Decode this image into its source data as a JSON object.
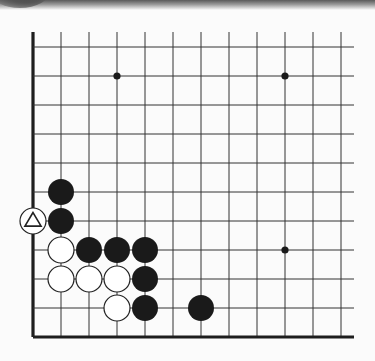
{
  "diagram": {
    "grid": {
      "columns_x": [
        33,
        61,
        89,
        117,
        145,
        173,
        201,
        229,
        257,
        285,
        313,
        341
      ],
      "rows_y": [
        47,
        76,
        105,
        134,
        163,
        192,
        221,
        250,
        279,
        308,
        337
      ],
      "top_y": 32,
      "right_x": 354,
      "left_edge_col": 0,
      "bottom_edge_row": 10
    },
    "star_points": [
      {
        "col": 3,
        "row": 1
      },
      {
        "col": 9,
        "row": 1
      },
      {
        "col": 9,
        "row": 7
      }
    ],
    "stones": [
      {
        "color": "black",
        "col": 1,
        "row": 5
      },
      {
        "color": "black",
        "col": 1,
        "row": 6
      },
      {
        "color": "black",
        "col": 2,
        "row": 7
      },
      {
        "color": "black",
        "col": 3,
        "row": 7
      },
      {
        "color": "black",
        "col": 4,
        "row": 7
      },
      {
        "color": "black",
        "col": 4,
        "row": 8
      },
      {
        "color": "black",
        "col": 4,
        "row": 9
      },
      {
        "color": "black",
        "col": 6,
        "row": 9
      },
      {
        "color": "white",
        "col": 0,
        "row": 6,
        "mark": "triangle"
      },
      {
        "color": "white",
        "col": 1,
        "row": 7
      },
      {
        "color": "white",
        "col": 1,
        "row": 8
      },
      {
        "color": "white",
        "col": 2,
        "row": 8
      },
      {
        "color": "white",
        "col": 3,
        "row": 8
      },
      {
        "color": "white",
        "col": 3,
        "row": 9
      }
    ],
    "colors": {
      "line": "#333333",
      "edge": "#1e1e1e",
      "black_stone": "#1a1a1a",
      "white_stone": "#ffffff",
      "stone_outline": "#222222",
      "background": "#fbfbfb"
    },
    "stone_radius": 13
  }
}
